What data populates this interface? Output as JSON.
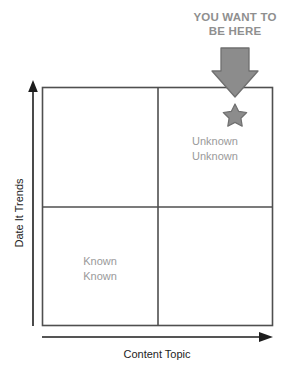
{
  "diagram": {
    "type": "2x2-matrix",
    "title": "",
    "callout": {
      "line1": "YOU WANT TO",
      "line2": "BE HERE",
      "color": "#8f8f8f",
      "pointer_icon": "down-arrow-icon",
      "target_icon": "star-icon"
    },
    "axes": {
      "y_label": "Date It Trends",
      "x_label": "Content Topic",
      "axis_color": "#1d1d1d",
      "y_arrow_icon": "arrow-up-icon",
      "x_arrow_icon": "arrow-right-icon"
    },
    "grid": {
      "border_color": "#4f4f4f",
      "divider_color": "#4f4f4f",
      "fill": "#ffffff"
    },
    "quadrants": [
      {
        "position": "top-left",
        "line1": "",
        "line2": ""
      },
      {
        "position": "top-right",
        "line1": "Unknown",
        "line2": "Unknown",
        "color": "#9a9a9a",
        "marked": true
      },
      {
        "position": "bottom-left",
        "line1": "Known",
        "line2": "Known",
        "color": "#9a9a9a",
        "marked": false
      },
      {
        "position": "bottom-right",
        "line1": "",
        "line2": ""
      }
    ],
    "marker": {
      "shape": "star",
      "fill": "#8c8c8c",
      "stroke": "#6a6a6a"
    },
    "pointer": {
      "shape": "block-arrow-down",
      "fill": "#8c8c8c",
      "stroke": "#6a6a6a"
    }
  }
}
